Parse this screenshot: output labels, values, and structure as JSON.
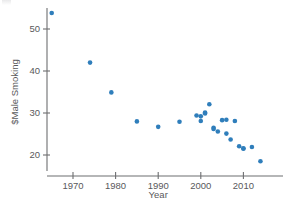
{
  "chart_data": {
    "type": "scatter",
    "title": "",
    "subtitle": "",
    "xlabel": "Year",
    "ylabel": "$Male Smoking",
    "xlim": [
      1963,
      2016
    ],
    "ylim": [
      16.5,
      56
    ],
    "xticks": [
      1970,
      1980,
      1990,
      2000,
      2010
    ],
    "xtick_labels": [
      "1970",
      "1980",
      "1990",
      "2000",
      "2010"
    ],
    "yticks": [
      20,
      30,
      40,
      50
    ],
    "ytick_labels": [
      "20",
      "30",
      "40",
      "50"
    ],
    "grid": false,
    "legend": null,
    "marker_color": "#2f7ebb",
    "marker_size": 4.6,
    "axis_color": "#6d6e70",
    "text_color": "#59595b",
    "background": "#ffffff",
    "series": [
      {
        "name": "Male Smoking",
        "points": [
          {
            "x": 1965,
            "y": 53.8
          },
          {
            "x": 1974,
            "y": 42.0
          },
          {
            "x": 1979,
            "y": 34.9
          },
          {
            "x": 1985,
            "y": 28.0
          },
          {
            "x": 1990,
            "y": 26.7
          },
          {
            "x": 1995,
            "y": 27.9
          },
          {
            "x": 1999,
            "y": 29.4
          },
          {
            "x": 2000,
            "y": 29.2
          },
          {
            "x": 2000,
            "y": 28.1
          },
          {
            "x": 2001,
            "y": 30.1
          },
          {
            "x": 2001,
            "y": 29.9
          },
          {
            "x": 2002,
            "y": 32.1
          },
          {
            "x": 2003,
            "y": 26.5
          },
          {
            "x": 2003,
            "y": 26.2
          },
          {
            "x": 2004,
            "y": 25.6
          },
          {
            "x": 2005,
            "y": 28.3
          },
          {
            "x": 2006,
            "y": 28.4
          },
          {
            "x": 2006,
            "y": 25.1
          },
          {
            "x": 2007,
            "y": 23.7
          },
          {
            "x": 2008,
            "y": 28.1
          },
          {
            "x": 2009,
            "y": 22.1
          },
          {
            "x": 2010,
            "y": 21.6
          },
          {
            "x": 2010,
            "y": 21.5
          },
          {
            "x": 2012,
            "y": 21.9
          },
          {
            "x": 2014,
            "y": 18.5
          }
        ]
      }
    ]
  },
  "axes_geometry": {
    "x_pixel_1970": 73,
    "x_pixels_per_year": 4.26,
    "y_pixel_20": 155,
    "y_pixels_per_unit": 4.2,
    "x_axis_y": 176,
    "y_axis_x": 47,
    "y_axis_top": 8,
    "y_axis_bottom": 171,
    "x_axis_left": 47,
    "x_axis_right": 283
  }
}
